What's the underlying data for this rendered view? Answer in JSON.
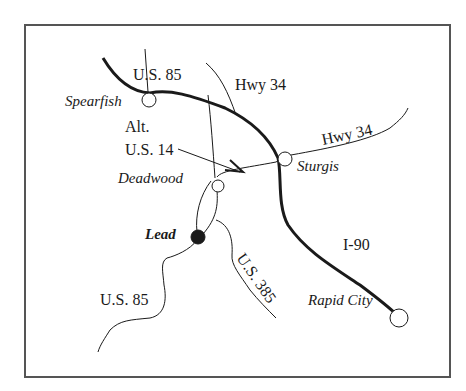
{
  "map": {
    "colors": {
      "frame": "#555555",
      "road": "#1a1a1a",
      "background": "#ffffff"
    },
    "cities": [
      {
        "name": "Spearfish",
        "style": "italic",
        "marker": "open-circle"
      },
      {
        "name": "Deadwood",
        "style": "italic",
        "marker": "open-circle"
      },
      {
        "name": "Lead",
        "style": "bold-italic",
        "marker": "filled-circle"
      },
      {
        "name": "Sturgis",
        "style": "italic",
        "marker": "open-circle"
      },
      {
        "name": "Rapid City",
        "style": "italic",
        "marker": "open-circle"
      }
    ],
    "roads": [
      {
        "label": "U.S. 85",
        "position": "north"
      },
      {
        "label": "Hwy 34",
        "position": "north"
      },
      {
        "label": "Alt. U.S. 14",
        "line1": "Alt.",
        "line2": "U.S. 14"
      },
      {
        "label": "Hwy 34",
        "position": "east"
      },
      {
        "label": "I-90"
      },
      {
        "label": "U.S. 385"
      },
      {
        "label": "U.S. 85",
        "position": "south"
      }
    ]
  }
}
